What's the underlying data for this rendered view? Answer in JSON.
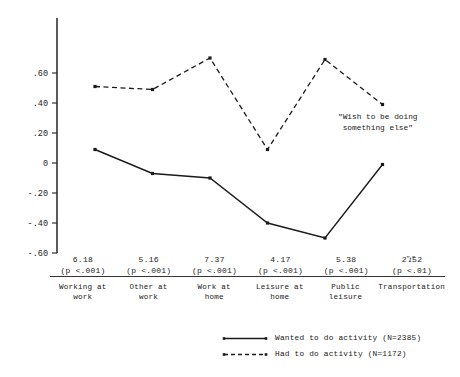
{
  "chart_data": {
    "type": "line",
    "title": "",
    "xlabel": "",
    "ylabel": "",
    "ylim": [
      -0.6,
      0.6
    ],
    "ytick_labels": [
      ".60",
      ".40",
      ".20",
      "0",
      "-.20",
      "-.40",
      "-.60"
    ],
    "ytick_values": [
      0.6,
      0.4,
      0.2,
      0,
      -0.2,
      -0.4,
      -0.6
    ],
    "grid": false,
    "legend_position": "bottom-right",
    "categories": [
      "Working at work",
      "Other at work",
      "Work at home",
      "Leisure at home",
      "Public leisure",
      "Transportation"
    ],
    "series": [
      {
        "name": "Wanted to do activity (N=2385)",
        "style": "solid",
        "values": [
          0.09,
          -0.07,
          -0.1,
          -0.4,
          -0.5,
          -0.01
        ]
      },
      {
        "name": "Had to do activity (N=1172)",
        "style": "dashed",
        "values": [
          0.51,
          0.49,
          0.7,
          0.09,
          0.69,
          0.39
        ]
      }
    ],
    "annotations": [
      {
        "name": "wish-annotation",
        "line1": "\"Wish to be doing",
        "line2": "something else\""
      }
    ]
  },
  "axis": {
    "ticks": [
      {
        "label": ".60",
        "value": 0.6
      },
      {
        "label": ".40",
        "value": 0.4
      },
      {
        "label": ".20",
        "value": 0.2
      },
      {
        "label": "0",
        "value": 0
      },
      {
        "label": "-.20",
        "value": -0.2
      },
      {
        "label": "-.40",
        "value": -0.4
      },
      {
        "label": "-.60",
        "value": -0.6
      }
    ]
  },
  "stats_table": {
    "t_symbol": "\"t\"",
    "columns": [
      {
        "t_value": "6.18",
        "p_value": "(p <.001)",
        "category_line1": "Working at",
        "category_line2": "work"
      },
      {
        "t_value": "5.16",
        "p_value": "(p <.001)",
        "category_line1": "Other at",
        "category_line2": "work"
      },
      {
        "t_value": "7.37",
        "p_value": "(p <.001)",
        "category_line1": "Work at",
        "category_line2": "home"
      },
      {
        "t_value": "4.17",
        "p_value": "(p <.001)",
        "category_line1": "Leisure at",
        "category_line2": "home"
      },
      {
        "t_value": "5.38",
        "p_value": "(p <.001)",
        "category_line1": "Public",
        "category_line2": "leisure"
      },
      {
        "t_value": "2.52",
        "p_value": "(p <.01)",
        "category_line1": "Transportation",
        "category_line2": ""
      }
    ]
  },
  "legend": {
    "entries": [
      {
        "label": "Wanted to do activity (N=2385)",
        "style": "solid"
      },
      {
        "label": "Had to do activity (N=1172)",
        "style": "dashed"
      }
    ]
  },
  "colors": {
    "ink": "#1a1a1a",
    "axis": "#333333",
    "background": "#ffffff"
  }
}
